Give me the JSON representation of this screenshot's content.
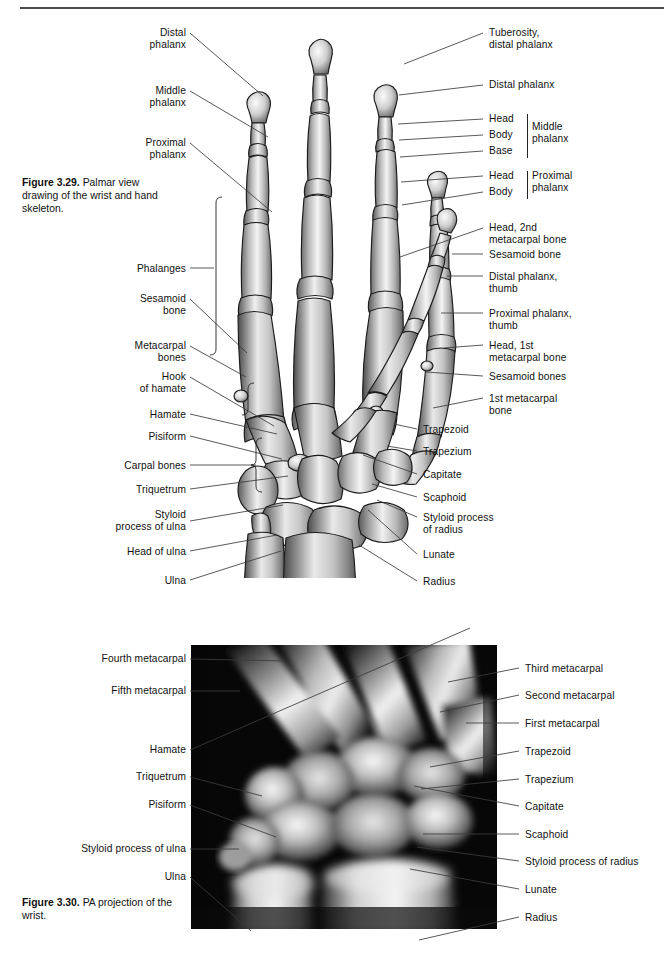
{
  "page": {
    "width": 664,
    "height": 955,
    "background": "#ffffff",
    "rule_color": "#4a4a4a"
  },
  "figure_329": {
    "caption_bold": "Figure 3.29.",
    "caption_text": " Palmar view drawing of the wrist and hand skeleton.",
    "caption_full": "Figure 3.29. Palmar view drawing of the wrist and hand skeleton.",
    "art_name": "palmar-view-hand-skeleton-drawing",
    "labels_left": [
      {
        "id": "distal-phalanx",
        "text": "Distal\nphalanx",
        "x": 100,
        "y": 27,
        "w": 86,
        "leader": [
          [
            190,
            33
          ],
          [
            263,
            96
          ]
        ]
      },
      {
        "id": "middle-phalanx",
        "text": "Middle\nphalanx",
        "x": 100,
        "y": 85,
        "w": 86,
        "leader": [
          [
            190,
            91
          ],
          [
            268,
            137
          ]
        ]
      },
      {
        "id": "proximal-phalanx",
        "text": "Proximal\nphalanx",
        "x": 96,
        "y": 137,
        "w": 90,
        "leader": [
          [
            190,
            143
          ],
          [
            272,
            212
          ]
        ]
      },
      {
        "id": "phalanges",
        "text": "Phalanges",
        "x": 118,
        "y": 263,
        "w": 68,
        "leader": [
          [
            190,
            268
          ],
          [
            214,
            268
          ]
        ]
      },
      {
        "id": "sesamoid-bone",
        "text": "Sesamoid\nbone",
        "x": 108,
        "y": 293,
        "w": 78,
        "leader": [
          [
            190,
            299
          ],
          [
            247,
            353
          ]
        ]
      },
      {
        "id": "metacarpal-bones",
        "text": "Metacarpal\nbones",
        "x": 100,
        "y": 340,
        "w": 86,
        "leader": [
          [
            190,
            346
          ],
          [
            246,
            377
          ]
        ]
      },
      {
        "id": "hook-of-hamate",
        "text": "Hook\nof hamate",
        "x": 106,
        "y": 371,
        "w": 80,
        "leader": [
          [
            190,
            377
          ],
          [
            274,
            426
          ]
        ]
      },
      {
        "id": "hamate",
        "text": "Hamate",
        "x": 131,
        "y": 409,
        "w": 55,
        "leader": [
          [
            190,
            414
          ],
          [
            277,
            434
          ]
        ]
      },
      {
        "id": "pisiform",
        "text": "Pisiform",
        "x": 128,
        "y": 431,
        "w": 58,
        "leader": [
          [
            190,
            436
          ],
          [
            282,
            459
          ]
        ]
      },
      {
        "id": "carpal-bones",
        "text": "Carpal bones",
        "x": 101,
        "y": 460,
        "w": 85,
        "leader": [
          [
            190,
            465
          ],
          [
            256,
            465
          ]
        ]
      },
      {
        "id": "triquetrum",
        "text": "Triquetrum",
        "x": 114,
        "y": 484,
        "w": 72,
        "leader": [
          [
            190,
            489
          ],
          [
            288,
            476
          ]
        ]
      },
      {
        "id": "styloid-process-of-ulna",
        "text": "Styloid\nprocess of ulna",
        "x": 68,
        "y": 509,
        "w": 118,
        "leader": [
          [
            190,
            521
          ],
          [
            283,
            505
          ]
        ]
      },
      {
        "id": "head-of-ulna",
        "text": "Head of ulna",
        "x": 103,
        "y": 546,
        "w": 83,
        "leader": [
          [
            190,
            551
          ],
          [
            277,
            535
          ]
        ]
      },
      {
        "id": "ulna",
        "text": "Ulna",
        "x": 154,
        "y": 575,
        "w": 32,
        "leader": [
          [
            190,
            580
          ],
          [
            281,
            551
          ]
        ]
      }
    ],
    "labels_right": [
      {
        "id": "tuberosity-distal-phalanx",
        "text": "Tuberosity,\ndistal phalanx",
        "x": 489,
        "y": 27,
        "w": 120,
        "leader": [
          [
            483,
            33
          ],
          [
            404,
            64
          ]
        ]
      },
      {
        "id": "distal-phalanx-r",
        "text": "Distal phalanx",
        "x": 489,
        "y": 79,
        "w": 120,
        "leader": [
          [
            483,
            85
          ],
          [
            399,
            95
          ]
        ]
      },
      {
        "id": "head-middle",
        "text": "Head",
        "x": 489,
        "y": 113,
        "w": 34,
        "leader": [
          [
            483,
            119
          ],
          [
            398,
            124
          ]
        ]
      },
      {
        "id": "body-middle",
        "text": "Body",
        "x": 489,
        "y": 129,
        "w": 34,
        "leader": [
          [
            483,
            135
          ],
          [
            399,
            140
          ]
        ]
      },
      {
        "id": "base-middle",
        "text": "Base",
        "x": 489,
        "y": 145,
        "w": 34,
        "leader": [
          [
            483,
            151
          ],
          [
            400,
            157
          ]
        ]
      },
      {
        "id": "middle-phalanx-group",
        "text": "Middle\nphalanx",
        "x": 532,
        "y": 121,
        "w": 60
      },
      {
        "id": "head-proximal",
        "text": "Head",
        "x": 489,
        "y": 170,
        "w": 34,
        "leader": [
          [
            483,
            176
          ],
          [
            401,
            182
          ]
        ]
      },
      {
        "id": "body-proximal",
        "text": "Body",
        "x": 489,
        "y": 186,
        "w": 34,
        "leader": [
          [
            483,
            192
          ],
          [
            402,
            205
          ]
        ]
      },
      {
        "id": "proximal-phalanx-group",
        "text": "Proximal\nphalanx",
        "x": 532,
        "y": 170,
        "w": 66
      },
      {
        "id": "head-2nd-metacarpal",
        "text": "Head, 2nd\nmetacarpal bone",
        "x": 489,
        "y": 222,
        "w": 128,
        "leader": [
          [
            483,
            228
          ],
          [
            400,
            257
          ]
        ]
      },
      {
        "id": "sesamoid-bone-r",
        "text": "Sesamoid bone",
        "x": 489,
        "y": 249,
        "w": 128,
        "leader": [
          [
            483,
            254
          ],
          [
            452,
            254
          ]
        ]
      },
      {
        "id": "distal-phalanx-thumb",
        "text": "Distal phalanx,\nthumb",
        "x": 489,
        "y": 271,
        "w": 128,
        "leader": [
          [
            483,
            276
          ],
          [
            447,
            276
          ]
        ]
      },
      {
        "id": "proximal-phalanx-thumb",
        "text": "Proximal phalanx,\nthumb",
        "x": 489,
        "y": 308,
        "w": 140,
        "leader": [
          [
            483,
            313
          ],
          [
            441,
            313
          ]
        ]
      },
      {
        "id": "head-1st-metacarpal",
        "text": "Head, 1st\nmetacarpal bone",
        "x": 489,
        "y": 340,
        "w": 128,
        "leader": [
          [
            483,
            345
          ],
          [
            444,
            348
          ]
        ]
      },
      {
        "id": "sesamoid-bones",
        "text": "Sesamoid bones",
        "x": 489,
        "y": 371,
        "w": 128,
        "leader": [
          [
            483,
            376
          ],
          [
            426,
            372
          ]
        ]
      },
      {
        "id": "1st-metacarpal-bone",
        "text": "1st metacarpal\nbone",
        "x": 489,
        "y": 393,
        "w": 128,
        "leader": [
          [
            483,
            398
          ],
          [
            433,
            408
          ]
        ]
      },
      {
        "id": "trapezoid-r",
        "text": "Trapezoid",
        "x": 423,
        "y": 424,
        "w": 70,
        "leader": [
          [
            417,
            429
          ],
          [
            394,
            424
          ]
        ]
      },
      {
        "id": "trapezium-r",
        "text": "Trapezium",
        "x": 423,
        "y": 446,
        "w": 70,
        "leader": [
          [
            417,
            451
          ],
          [
            387,
            446
          ]
        ]
      },
      {
        "id": "capitate-r",
        "text": "Capitate",
        "x": 423,
        "y": 469,
        "w": 70,
        "leader": [
          [
            417,
            474
          ],
          [
            363,
            455
          ]
        ]
      },
      {
        "id": "scaphoid-r",
        "text": "Scaphoid",
        "x": 423,
        "y": 492,
        "w": 70,
        "leader": [
          [
            417,
            497
          ],
          [
            372,
            484
          ]
        ]
      },
      {
        "id": "styloid-process-of-radius",
        "text": "Styloid process\nof radius",
        "x": 423,
        "y": 512,
        "w": 110,
        "leader": [
          [
            417,
            517
          ],
          [
            377,
            500
          ]
        ]
      },
      {
        "id": "lunate-r",
        "text": "Lunate",
        "x": 423,
        "y": 549,
        "w": 70,
        "leader": [
          [
            417,
            554
          ],
          [
            368,
            510
          ]
        ]
      },
      {
        "id": "radius-r",
        "text": "Radius",
        "x": 423,
        "y": 576,
        "w": 70,
        "leader": [
          [
            417,
            581
          ],
          [
            359,
            545
          ]
        ]
      }
    ]
  },
  "figure_330": {
    "caption_bold": "Figure 3.30.",
    "caption_text": " PA projection of the wrist.",
    "caption_full": "Figure 3.30. PA projection of the wrist.",
    "art_name": "pa-projection-wrist-radiograph",
    "image_alt": "PA projection radiograph of the wrist",
    "labels_left": [
      {
        "id": "fourth-metacarpal",
        "text": "Fourth metacarpal",
        "x": 72,
        "y": 653,
        "w": 114,
        "leader": [
          [
            190,
            659
          ],
          [
            285,
            661
          ]
        ]
      },
      {
        "id": "fifth-metacarpal",
        "text": "Fifth metacarpal",
        "x": 81,
        "y": 685,
        "w": 105,
        "leader": [
          [
            190,
            691
          ],
          [
            240,
            691
          ]
        ]
      },
      {
        "id": "hamate-x",
        "text": "Hamate",
        "x": 131,
        "y": 744,
        "w": 55,
        "leader": [
          [
            190,
            750
          ],
          [
            470,
            628
          ]
        ]
      },
      {
        "id": "triquetrum-x",
        "text": "Triquetrum",
        "x": 114,
        "y": 771,
        "w": 72,
        "leader": [
          [
            190,
            777
          ],
          [
            262,
            796
          ]
        ]
      },
      {
        "id": "pisiform-x",
        "text": "Pisiform",
        "x": 128,
        "y": 799,
        "w": 58,
        "leader": [
          [
            190,
            805
          ],
          [
            276,
            837
          ]
        ]
      },
      {
        "id": "styloid-process-of-ulna-x",
        "text": "Styloid process of ulna",
        "x": 46,
        "y": 843,
        "w": 140,
        "leader": [
          [
            190,
            849
          ],
          [
            239,
            849
          ]
        ]
      },
      {
        "id": "ulna-x",
        "text": "Ulna",
        "x": 154,
        "y": 871,
        "w": 32,
        "leader": [
          [
            190,
            877
          ],
          [
            251,
            931
          ]
        ]
      }
    ],
    "labels_right": [
      {
        "id": "third-metacarpal",
        "text": "Third metacarpal",
        "x": 525,
        "y": 663,
        "w": 128,
        "leader": [
          [
            519,
            668
          ],
          [
            448,
            682
          ]
        ]
      },
      {
        "id": "second-metacarpal",
        "text": "Second metacarpal",
        "x": 525,
        "y": 690,
        "w": 128,
        "leader": [
          [
            519,
            695
          ],
          [
            440,
            712
          ]
        ]
      },
      {
        "id": "first-metacarpal",
        "text": "First metacarpal",
        "x": 525,
        "y": 718,
        "w": 128,
        "leader": [
          [
            519,
            723
          ],
          [
            466,
            723
          ]
        ]
      },
      {
        "id": "trapezoid-x",
        "text": "Trapezoid",
        "x": 525,
        "y": 746,
        "w": 128,
        "leader": [
          [
            519,
            751
          ],
          [
            430,
            767
          ]
        ]
      },
      {
        "id": "trapezium-x",
        "text": "Trapezium",
        "x": 525,
        "y": 774,
        "w": 128,
        "leader": [
          [
            519,
            779
          ],
          [
            421,
            789
          ]
        ]
      },
      {
        "id": "capitate-x",
        "text": "Capitate",
        "x": 525,
        "y": 801,
        "w": 128,
        "leader": [
          [
            519,
            806
          ],
          [
            414,
            786
          ]
        ]
      },
      {
        "id": "scaphoid-x",
        "text": "Scaphoid",
        "x": 525,
        "y": 829,
        "w": 128,
        "leader": [
          [
            519,
            834
          ],
          [
            423,
            834
          ]
        ]
      },
      {
        "id": "styloid-process-of-radius-x",
        "text": "Styloid process of radius",
        "x": 525,
        "y": 856,
        "w": 140,
        "leader": [
          [
            519,
            861
          ],
          [
            417,
            847
          ]
        ]
      },
      {
        "id": "lunate-x",
        "text": "Lunate",
        "x": 525,
        "y": 884,
        "w": 128,
        "leader": [
          [
            519,
            889
          ],
          [
            410,
            869
          ]
        ]
      },
      {
        "id": "radius-x",
        "text": "Radius",
        "x": 525,
        "y": 912,
        "w": 128,
        "leader": [
          [
            519,
            917
          ],
          [
            419,
            940
          ]
        ]
      }
    ]
  }
}
